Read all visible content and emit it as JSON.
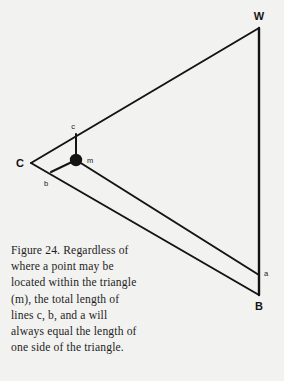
{
  "figure": {
    "background_color": "#f2f2f0",
    "ink_color": "#141414",
    "vertices": [
      {
        "id": "C",
        "label": "C",
        "x": 31,
        "y": 163,
        "label_x": 20,
        "label_y": 167
      },
      {
        "id": "W",
        "label": "W",
        "x": 259,
        "y": 28,
        "label_x": 259,
        "label_y": 20
      },
      {
        "id": "B",
        "label": "B",
        "x": 259,
        "y": 295,
        "label_x": 259,
        "label_y": 309
      }
    ],
    "interior_point": {
      "id": "m",
      "label": "m",
      "x": 76,
      "y": 160,
      "radius": 6
    },
    "segments": [
      {
        "id": "c",
        "label": "c",
        "from_x": 76,
        "from_y": 160,
        "to_x": 76,
        "to_y": 134,
        "label_x": 73,
        "label_y": 128
      },
      {
        "id": "b",
        "label": "b",
        "from_x": 76,
        "from_y": 160,
        "to_x": 51,
        "to_y": 172,
        "label_x": 46,
        "label_y": 185
      },
      {
        "id": "a",
        "label": "a",
        "from_x": 76,
        "from_y": 160,
        "to_x": 259,
        "to_y": 275,
        "label_x": 265,
        "label_y": 274
      }
    ],
    "triangle_sides": [
      {
        "id": "CW",
        "from_x": 31,
        "from_y": 163,
        "to_x": 259,
        "to_y": 28
      },
      {
        "id": "WB",
        "from_x": 259,
        "from_y": 28,
        "to_x": 259,
        "to_y": 295
      },
      {
        "id": "CB",
        "from_x": 31,
        "from_y": 163,
        "to_x": 259,
        "to_y": 295
      }
    ]
  },
  "caption": {
    "full_text": "Figure 24. Regardless of where a point may be located within the triangle (m), the total length of lines c, b, and a will always equal the length of one side of the triangle.",
    "lines": [
      "Figure 24. Regardless of",
      "where a point may be",
      "located within the triangle",
      "(m), the total length of",
      "lines c, b, and a will",
      "always equal the length of",
      "one side of the triangle."
    ]
  }
}
